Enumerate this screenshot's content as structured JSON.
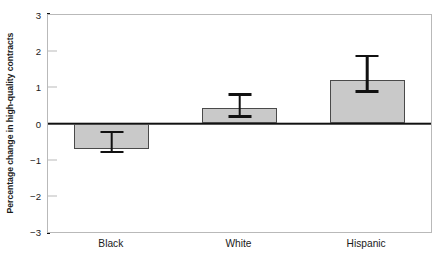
{
  "chart_data": {
    "type": "bar",
    "title": "",
    "xlabel": "",
    "ylabel": "Percentage change in high-quality contracts",
    "categories": [
      "Black",
      "White",
      "Hispanic"
    ],
    "values": [
      -0.7,
      0.43,
      1.2
    ],
    "error_low": [
      -0.82,
      0.16,
      0.85
    ],
    "error_high": [
      -0.2,
      0.83,
      1.9
    ],
    "ylim": [
      -3,
      3
    ],
    "yticks": [
      3,
      2,
      1,
      0,
      -1,
      -2,
      -3
    ],
    "ytick_labels": [
      "3",
      "2",
      "1",
      "0",
      "−1",
      "−2",
      "−3"
    ],
    "grid": false,
    "legend": null,
    "zero_line": 0,
    "bar_color": "#c9c9c9",
    "bar_edge_color": "#4a4a4a",
    "error_color": "#111111",
    "axis_color": "#111111",
    "frame_color": "#b9b9b9"
  }
}
